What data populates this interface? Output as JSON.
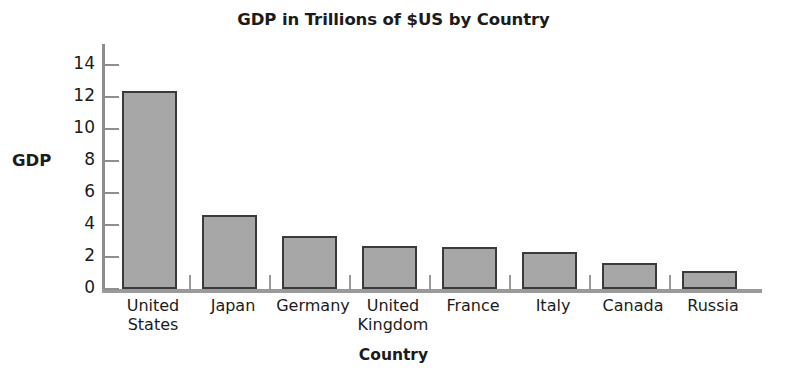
{
  "chart_data": {
    "type": "bar",
    "title": "GDP in Trillions of $US by Country",
    "xlabel": "Country",
    "ylabel": "GDP",
    "categories": [
      "United States",
      "Japan",
      "Germany",
      "United Kingdom",
      "France",
      "Italy",
      "Canada",
      "Russia"
    ],
    "category_lines": [
      [
        "United",
        "States"
      ],
      [
        "Japan"
      ],
      [
        "Germany"
      ],
      [
        "United",
        "Kingdom"
      ],
      [
        "France"
      ],
      [
        "Italy"
      ],
      [
        "Canada"
      ],
      [
        "Russia"
      ]
    ],
    "values": [
      12.4,
      4.6,
      3.3,
      2.7,
      2.6,
      2.3,
      1.6,
      1.15
    ],
    "ylim": [
      0,
      15
    ],
    "yticks": [
      0,
      2,
      4,
      6,
      8,
      10,
      12,
      14
    ],
    "ytick_labels": [
      "0",
      "2",
      "4",
      "6",
      "8",
      "10",
      "12",
      "14"
    ],
    "grid": false,
    "legend": false,
    "bar_color": "#a7a7a7",
    "bar_edge_color": "#3a3a3a",
    "axis_color": "#9a9a9a",
    "text_color": "#1b1b1b",
    "background": "#ffffff"
  }
}
